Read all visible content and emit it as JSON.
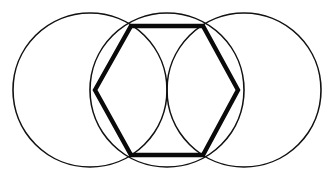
{
  "figure": {
    "title": "",
    "caption": "",
    "background_color": "#FFFFFF",
    "stroke_color": "#111111",
    "thick_stroke_color": "#0A0A0A",
    "canvas": {
      "width": 331,
      "height": 181
    }
  },
  "chart_data": {
    "type": "diagram",
    "title": "",
    "xlabel": "",
    "ylabel": "",
    "grid": false,
    "legend": "none",
    "circles": [
      {
        "name": "left-circle",
        "cx": 90,
        "cy": 90,
        "r": 77,
        "stroke": "#111111",
        "stroke_width": 1.6,
        "fill": "none"
      },
      {
        "name": "middle-circle",
        "cx": 167,
        "cy": 90,
        "r": 77,
        "stroke": "#111111",
        "stroke_width": 1.6,
        "fill": "none"
      },
      {
        "name": "right-circle",
        "cx": 244,
        "cy": 90,
        "r": 77,
        "stroke": "#111111",
        "stroke_width": 1.6,
        "fill": "none"
      }
    ],
    "hexagon": {
      "name": "inscribed-hexagon",
      "stroke": "#0A0A0A",
      "stroke_width": 4.4,
      "fill": "none",
      "closed": true,
      "vertices": [
        {
          "label": "left",
          "x": 95,
          "y": 90
        },
        {
          "label": "top-left",
          "x": 131,
          "y": 26
        },
        {
          "label": "top-right",
          "x": 203,
          "y": 26
        },
        {
          "label": "right",
          "x": 238,
          "y": 90
        },
        {
          "label": "bottom-right",
          "x": 203,
          "y": 155
        },
        {
          "label": "bottom-left",
          "x": 131,
          "y": 155
        }
      ]
    },
    "points": [],
    "annotations": []
  }
}
